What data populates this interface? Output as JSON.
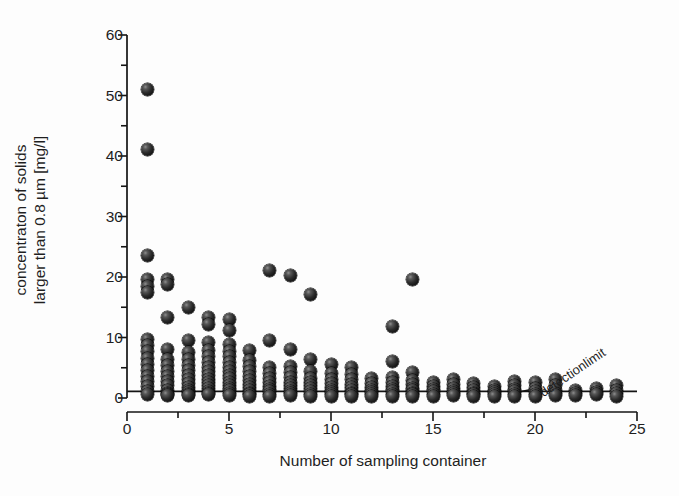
{
  "chart_data": {
    "type": "scatter",
    "title": "",
    "xlabel": "Number of sampling container",
    "ylabel_line1": "concentraton of solids",
    "ylabel_line2": "larger than 0.8 µm [mg/l]",
    "xlim": [
      0,
      25
    ],
    "ylim": [
      0,
      60
    ],
    "xticks": [
      0,
      5,
      10,
      15,
      20,
      25
    ],
    "yticks": [
      0,
      10,
      20,
      30,
      40,
      50,
      60
    ],
    "x_minor_tick_step": 2.5,
    "y_minor_tick_step": 5,
    "grid": false,
    "legend": null,
    "annotations": [
      {
        "text": "detectionlimit",
        "x": 20.3,
        "y": 2.0,
        "rotation_deg": -34,
        "leader_from": [
          20.1,
          1.6
        ],
        "leader_to": [
          19.1,
          0.9
        ]
      }
    ],
    "reference_lines": [
      {
        "name": "detection-limit-line",
        "orientation": "horizontal",
        "y": 1.1,
        "x_from": 0,
        "x_to": 25
      }
    ],
    "marker": {
      "style": "shaded-sphere",
      "color": "#1a1a1a",
      "size_px": 13
    },
    "points": [
      [
        1,
        51.0
      ],
      [
        1,
        41.0
      ],
      [
        1,
        23.5
      ],
      [
        1,
        19.6
      ],
      [
        1,
        18.4
      ],
      [
        1,
        17.4
      ],
      [
        1,
        9.6
      ],
      [
        1,
        8.7
      ],
      [
        1,
        7.7
      ],
      [
        1,
        6.6
      ],
      [
        1,
        5.6
      ],
      [
        1,
        4.6
      ],
      [
        1,
        3.6
      ],
      [
        1,
        2.7
      ],
      [
        1,
        1.9
      ],
      [
        1,
        1.1
      ],
      [
        1,
        0.5
      ],
      [
        2,
        19.6
      ],
      [
        2,
        18.8
      ],
      [
        2,
        13.3
      ],
      [
        2,
        8.0
      ],
      [
        2,
        6.4
      ],
      [
        2,
        5.4
      ],
      [
        2,
        4.4
      ],
      [
        2,
        3.5
      ],
      [
        2,
        2.7
      ],
      [
        2,
        2.0
      ],
      [
        2,
        1.3
      ],
      [
        2,
        0.8
      ],
      [
        2,
        0.5
      ],
      [
        2,
        0.4
      ],
      [
        3,
        15.0
      ],
      [
        3,
        9.5
      ],
      [
        3,
        7.5
      ],
      [
        3,
        6.3
      ],
      [
        3,
        5.4
      ],
      [
        3,
        4.6
      ],
      [
        3,
        3.8
      ],
      [
        3,
        3.1
      ],
      [
        3,
        2.4
      ],
      [
        3,
        1.8
      ],
      [
        3,
        1.2
      ],
      [
        3,
        0.9
      ],
      [
        3,
        0.6
      ],
      [
        3,
        0.4
      ],
      [
        4,
        13.3
      ],
      [
        4,
        12.2
      ],
      [
        4,
        9.2
      ],
      [
        4,
        7.8
      ],
      [
        4,
        6.8
      ],
      [
        4,
        5.9
      ],
      [
        4,
        5.1
      ],
      [
        4,
        4.4
      ],
      [
        4,
        3.7
      ],
      [
        4,
        3.1
      ],
      [
        4,
        2.6
      ],
      [
        4,
        2.0
      ],
      [
        4,
        1.5
      ],
      [
        4,
        1.1
      ],
      [
        4,
        0.8
      ],
      [
        4,
        0.5
      ],
      [
        5,
        13.0
      ],
      [
        5,
        11.1
      ],
      [
        5,
        8.9
      ],
      [
        5,
        7.7
      ],
      [
        5,
        6.8
      ],
      [
        5,
        5.9
      ],
      [
        5,
        5.1
      ],
      [
        5,
        4.4
      ],
      [
        5,
        3.8
      ],
      [
        5,
        3.2
      ],
      [
        5,
        2.6
      ],
      [
        5,
        2.1
      ],
      [
        5,
        1.6
      ],
      [
        5,
        1.2
      ],
      [
        5,
        0.8
      ],
      [
        5,
        0.4
      ],
      [
        6,
        7.9
      ],
      [
        6,
        6.2
      ],
      [
        6,
        5.2
      ],
      [
        6,
        4.4
      ],
      [
        6,
        3.6
      ],
      [
        6,
        2.9
      ],
      [
        6,
        2.3
      ],
      [
        6,
        1.7
      ],
      [
        6,
        1.2
      ],
      [
        6,
        0.8
      ],
      [
        6,
        0.5
      ],
      [
        6,
        0.3
      ],
      [
        7,
        21.0
      ],
      [
        7,
        9.5
      ],
      [
        7,
        5.0
      ],
      [
        7,
        4.0
      ],
      [
        7,
        3.2
      ],
      [
        7,
        2.5
      ],
      [
        7,
        1.9
      ],
      [
        7,
        1.4
      ],
      [
        7,
        1.0
      ],
      [
        7,
        0.6
      ],
      [
        7,
        0.3
      ],
      [
        8,
        20.3
      ],
      [
        8,
        8.0
      ],
      [
        8,
        5.2
      ],
      [
        8,
        4.2
      ],
      [
        8,
        3.4
      ],
      [
        8,
        2.6
      ],
      [
        8,
        2.0
      ],
      [
        8,
        1.5
      ],
      [
        8,
        1.1
      ],
      [
        8,
        0.7
      ],
      [
        8,
        0.4
      ],
      [
        9,
        17.1
      ],
      [
        9,
        6.4
      ],
      [
        9,
        4.3
      ],
      [
        9,
        3.3
      ],
      [
        9,
        2.6
      ],
      [
        9,
        2.0
      ],
      [
        9,
        1.5
      ],
      [
        9,
        1.0
      ],
      [
        9,
        0.6
      ],
      [
        9,
        0.3
      ],
      [
        10,
        5.5
      ],
      [
        10,
        4.0
      ],
      [
        10,
        3.1
      ],
      [
        10,
        2.4
      ],
      [
        10,
        1.8
      ],
      [
        10,
        1.3
      ],
      [
        10,
        0.9
      ],
      [
        10,
        0.5
      ],
      [
        10,
        0.3
      ],
      [
        11,
        5.0
      ],
      [
        11,
        3.9
      ],
      [
        11,
        3.0
      ],
      [
        11,
        2.3
      ],
      [
        11,
        1.7
      ],
      [
        11,
        1.2
      ],
      [
        11,
        0.8
      ],
      [
        11,
        0.5
      ],
      [
        11,
        0.3
      ],
      [
        12,
        3.2
      ],
      [
        12,
        2.4
      ],
      [
        12,
        1.8
      ],
      [
        12,
        1.3
      ],
      [
        12,
        0.9
      ],
      [
        12,
        0.6
      ],
      [
        12,
        0.3
      ],
      [
        13,
        11.8
      ],
      [
        13,
        6.0
      ],
      [
        13,
        3.4
      ],
      [
        13,
        2.5
      ],
      [
        13,
        1.9
      ],
      [
        13,
        1.4
      ],
      [
        13,
        1.0
      ],
      [
        13,
        0.6
      ],
      [
        13,
        0.3
      ],
      [
        14,
        19.6
      ],
      [
        14,
        4.2
      ],
      [
        14,
        2.9
      ],
      [
        14,
        2.2
      ],
      [
        14,
        1.6
      ],
      [
        14,
        1.2
      ],
      [
        14,
        0.8
      ],
      [
        14,
        0.5
      ],
      [
        14,
        0.3
      ],
      [
        15,
        2.6
      ],
      [
        15,
        1.9
      ],
      [
        15,
        1.4
      ],
      [
        15,
        1.0
      ],
      [
        15,
        0.6
      ],
      [
        15,
        0.3
      ],
      [
        16,
        3.0
      ],
      [
        16,
        2.2
      ],
      [
        16,
        1.6
      ],
      [
        16,
        1.1
      ],
      [
        16,
        0.7
      ],
      [
        16,
        0.4
      ],
      [
        17,
        2.4
      ],
      [
        17,
        1.7
      ],
      [
        17,
        1.2
      ],
      [
        17,
        0.8
      ],
      [
        17,
        0.5
      ],
      [
        17,
        0.3
      ],
      [
        18,
        1.9
      ],
      [
        18,
        1.3
      ],
      [
        18,
        0.9
      ],
      [
        18,
        0.5
      ],
      [
        18,
        0.3
      ],
      [
        19,
        2.8
      ],
      [
        19,
        2.0
      ],
      [
        19,
        1.4
      ],
      [
        19,
        1.0
      ],
      [
        19,
        0.6
      ],
      [
        19,
        0.3
      ],
      [
        20,
        2.6
      ],
      [
        20,
        1.6
      ],
      [
        20,
        1.0
      ],
      [
        20,
        0.6
      ],
      [
        20,
        0.3
      ],
      [
        21,
        3.1
      ],
      [
        21,
        2.0
      ],
      [
        21,
        1.3
      ],
      [
        21,
        0.8
      ],
      [
        21,
        0.4
      ],
      [
        22,
        1.2
      ],
      [
        22,
        0.7
      ],
      [
        22,
        0.4
      ],
      [
        23,
        1.5
      ],
      [
        23,
        0.9
      ],
      [
        23,
        0.5
      ],
      [
        24,
        2.1
      ],
      [
        24,
        1.3
      ],
      [
        24,
        0.7
      ],
      [
        24,
        0.3
      ]
    ]
  },
  "axes": {
    "xtick_labels": [
      "0",
      "5",
      "10",
      "15",
      "20",
      "25"
    ],
    "ytick_labels": [
      "0",
      "10",
      "20",
      "30",
      "40",
      "50",
      "60"
    ]
  }
}
